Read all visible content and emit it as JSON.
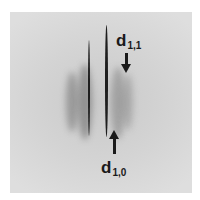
{
  "figure": {
    "labels": {
      "top": {
        "text": "d",
        "subscript": "1,1"
      },
      "bottom": {
        "text": "d",
        "subscript": "1,0"
      }
    },
    "colors": {
      "background": "#d4d4d4",
      "reflection": "#1e1e1e",
      "label": "#1a1a1a"
    }
  }
}
